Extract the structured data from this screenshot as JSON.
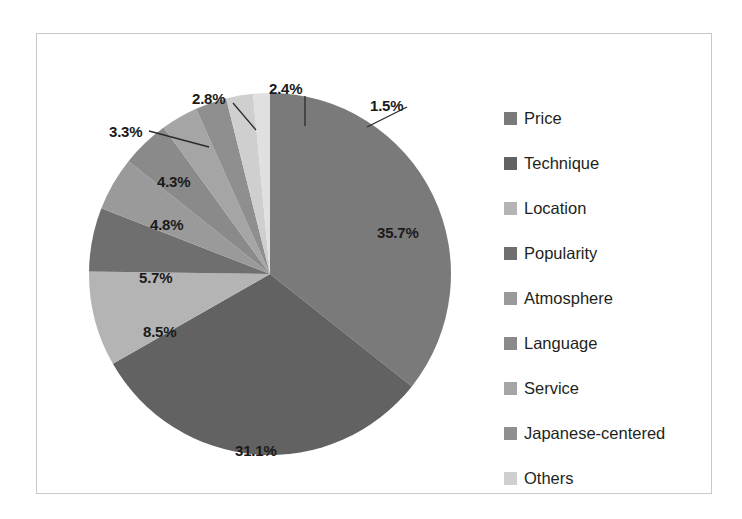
{
  "chart_data": {
    "type": "pie",
    "title": "",
    "legend_position": "right",
    "categories": [
      "Price",
      "Technique",
      "Location",
      "Popularity",
      "Atmosphere",
      "Language",
      "Service",
      "Japanese-centered",
      "Others"
    ],
    "values": [
      35.7,
      31.1,
      8.5,
      5.7,
      4.8,
      4.3,
      3.3,
      2.8,
      2.4
    ],
    "labels": [
      "35.7%",
      "31.1%",
      "8.5%",
      "5.7%",
      "4.8%",
      "4.3%",
      "3.3%",
      "2.8%",
      "2.4%",
      "1.5%"
    ],
    "slice_colors": [
      "#7a7a7a",
      "#626262",
      "#b4b4b4",
      "#6f6f6f",
      "#9a9a9a",
      "#8a8a8a",
      "#a5a5a5",
      "#8f8f8f",
      "#cfcfcf",
      "#e0e0e0"
    ],
    "extra_label": "1.5%",
    "units": "percent",
    "total": 100.1
  },
  "legend": {
    "items": [
      {
        "label": "Price",
        "color": "#7a7a7a"
      },
      {
        "label": "Technique",
        "color": "#626262"
      },
      {
        "label": "Location",
        "color": "#b4b4b4"
      },
      {
        "label": "Popularity",
        "color": "#6f6f6f"
      },
      {
        "label": "Atmosphere",
        "color": "#9a9a9a"
      },
      {
        "label": "Language",
        "color": "#8a8a8a"
      },
      {
        "label": "Service",
        "color": "#a5a5a5"
      },
      {
        "label": "Japanese-centered",
        "color": "#8f8f8f"
      },
      {
        "label": "Others",
        "color": "#cfcfcf"
      }
    ]
  },
  "slice_labels": [
    {
      "text": "35.7%",
      "x": 340,
      "y": 190
    },
    {
      "text": "31.1%",
      "x": 198,
      "y": 408
    },
    {
      "text": "8.5%",
      "x": 106,
      "y": 289
    },
    {
      "text": "5.7%",
      "x": 102,
      "y": 235
    },
    {
      "text": "4.8%",
      "x": 113,
      "y": 182
    },
    {
      "text": "4.3%",
      "x": 120,
      "y": 139
    },
    {
      "text": "3.3%",
      "x": 72,
      "y": 89
    },
    {
      "text": "2.8%",
      "x": 155,
      "y": 56
    },
    {
      "text": "2.4%",
      "x": 232,
      "y": 46
    },
    {
      "text": "1.5%",
      "x": 333,
      "y": 63
    }
  ],
  "frame": {
    "border_color": "#c9c9c9",
    "background": "#ffffff"
  }
}
